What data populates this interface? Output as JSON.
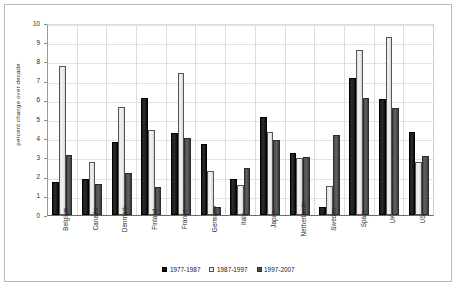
{
  "chart_data": {
    "type": "bar",
    "title": "",
    "xlabel": "",
    "ylabel": "percent change over decade",
    "ylim": [
      0,
      10
    ],
    "ytick_step": 1,
    "yticks": [
      "0",
      "1",
      "2",
      "3",
      "4",
      "5",
      "6",
      "7",
      "8",
      "9",
      "10"
    ],
    "grid": true,
    "legend_position": "bottom",
    "categories": [
      "Belgium",
      "Canada",
      "Denmark",
      "Finland",
      "France",
      "Germany",
      "Italy",
      "Japan",
      "Netherlands",
      "Sweden",
      "Spain",
      "UK",
      "US"
    ],
    "series": [
      {
        "name": "1977-1987",
        "color": "#141414",
        "values": [
          1.7,
          1.85,
          3.8,
          6.1,
          4.25,
          3.7,
          1.9,
          5.1,
          3.25,
          0.4,
          7.15,
          6.05,
          4.3
        ]
      },
      {
        "name": "1987-1997",
        "color": "#ececec",
        "values": [
          7.75,
          2.78,
          5.65,
          4.45,
          7.4,
          2.3,
          1.55,
          4.3,
          2.95,
          1.5,
          8.6,
          9.25,
          2.75
        ]
      },
      {
        "name": "1997-2007",
        "color": "#4d4d4d",
        "values": [
          3.15,
          1.6,
          2.2,
          1.45,
          4.0,
          0.4,
          2.45,
          3.9,
          3.0,
          4.15,
          6.1,
          5.55,
          3.05
        ]
      }
    ]
  }
}
